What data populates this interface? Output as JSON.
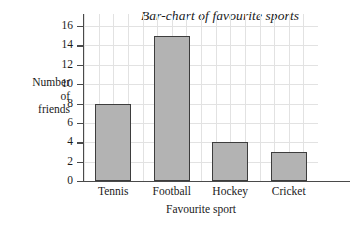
{
  "chart_data": {
    "type": "bar",
    "title": "Bar-chart of favourite sports",
    "xlabel": "Favourite sport",
    "ylabel": "Number of friends",
    "ylabel_lines": [
      "Number",
      "of",
      "friends"
    ],
    "categories": [
      "Tennis",
      "Football",
      "Hockey",
      "Cricket"
    ],
    "values": [
      8,
      15,
      4,
      3
    ],
    "ylim": [
      0,
      16
    ],
    "ytick_step": 2,
    "yticks": [
      0,
      2,
      4,
      6,
      8,
      10,
      12,
      14,
      16
    ],
    "ytick_labels": [
      "0",
      "2",
      "4",
      "6",
      "8",
      "10",
      "12",
      "14",
      "16"
    ],
    "grid": true,
    "grid_color": "#e2e2e2",
    "legend": null,
    "legend_position": "none",
    "bar_fill_color": "#b3b3b3",
    "bar_edge_color": "#3d3d3d",
    "axis_color": "#4a4a4a",
    "background_color": "#ffffff",
    "vertical_gridline_count": 16
  }
}
